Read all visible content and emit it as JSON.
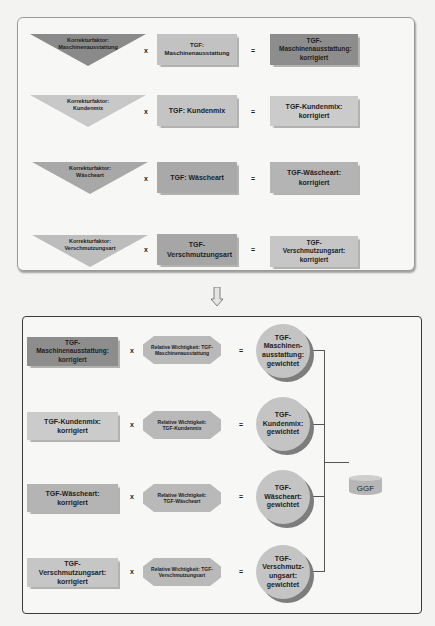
{
  "top_panel": {
    "rows": [
      {
        "factor": "Korrekturfaktor: Maschinenausstattung",
        "factor_color": "#8a8a8a",
        "op1": "x",
        "input": "TGF: Maschinenausstattung",
        "input_color": "#c2c2c2",
        "op2": "=",
        "result": "TGF-Maschinenausstattung: korrigiert",
        "result_color": "#8d8d8d"
      },
      {
        "factor": "Korrekturfaktor: Kundenmix",
        "factor_color": "#c8c8c8",
        "op1": "x",
        "input": "TGF: Kundenmix",
        "input_color": "#c4c4c4",
        "op2": "=",
        "result": "TGF-Kundenmix: korrigiert",
        "result_color": "#cbcbcb"
      },
      {
        "factor": "Korrekturfaktor: Wäscheart",
        "factor_color": "#a8a8a8",
        "op1": "x",
        "input": "TGF: Wäscheart",
        "input_color": "#a9a9a9",
        "op2": "=",
        "result": "TGF-Wäscheart: korrigiert",
        "result_color": "#b4b4b4"
      },
      {
        "factor": "Korrekturfaktor: Verschmutzungsart",
        "factor_color": "#bdbdbd",
        "op1": "x",
        "input": "TGF-Verschmutzungsart",
        "input_color": "#a6a6a6",
        "op2": "=",
        "result": "TGF-Verschmutzungsart: korrigiert",
        "result_color": "#c6c6c6"
      }
    ]
  },
  "arrow": {
    "icon": "down-arrow-icon"
  },
  "bottom_panel": {
    "rows": [
      {
        "input": "TGF-Maschinenausstattung: korrigiert",
        "input_color": "#8d8d8d",
        "op1": "x",
        "weight": "Relative Wichtigkeit: TGF-Maschinenausstattung",
        "op2": "=",
        "result": "TGF-Maschinen-ausstattung: gewichtet"
      },
      {
        "input": "TGF-Kundenmix: korrigiert",
        "input_color": "#cbcbcb",
        "op1": "x",
        "weight": "Relative Wichtigkeit: TGF-Kundenmix",
        "op2": "=",
        "result": "TGF-Kundenmix: gewichtet"
      },
      {
        "input": "TGF-Wäscheart: korrigiert",
        "input_color": "#b4b4b4",
        "op1": "x",
        "weight": "Relative Wichtigkeit: TGF-Wäscheart",
        "op2": "=",
        "result": "TGF-Wäscheart: gewichtet"
      },
      {
        "input": "TGF-Verschmutzungsart: korrigiert",
        "input_color": "#c6c6c6",
        "op1": "x",
        "weight": "Relative Wichtigkeit: TGF-Verschmutzungsart",
        "op2": "=",
        "result": "TGF-Verschmutz-ungsart: gewichtet"
      }
    ],
    "output": {
      "label": "GGF",
      "icon": "database-cylinder-icon"
    }
  }
}
